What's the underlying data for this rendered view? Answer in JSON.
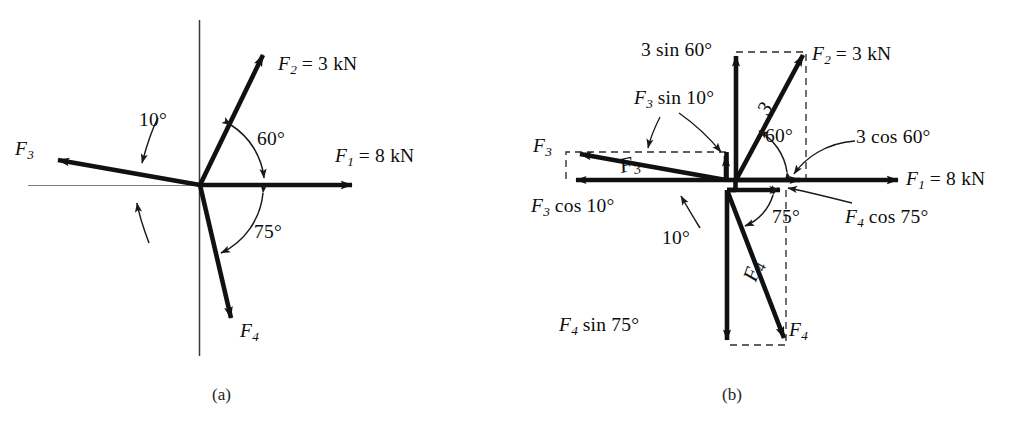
{
  "figure": {
    "background_color": "#ffffff",
    "line_color": "#111111",
    "dashed_color": "#2b2b2b",
    "axis_color": "#3a3a3a"
  },
  "panel_a": {
    "caption": "(a)",
    "labels": {
      "f1": "F1 = 8 kN",
      "f1_sym": "F",
      "f1_sub": "1",
      "f1_val": "= 8 kN",
      "f2_sym": "F",
      "f2_sub": "2",
      "f2_val": "= 3 kN",
      "f3_sym": "F",
      "f3_sub": "3",
      "f4_sym": "F",
      "f4_sub": "4",
      "angle_10": "10°",
      "angle_60": "60°",
      "angle_75": "75°"
    },
    "vectors": [
      {
        "name": "F1",
        "magnitude": "8 kN",
        "angle_deg": 0,
        "direction": "right"
      },
      {
        "name": "F2",
        "magnitude": "3 kN",
        "angle_deg": 60,
        "direction": "up-right"
      },
      {
        "name": "F3",
        "magnitude": "",
        "angle_deg": 190,
        "direction": "up-left"
      },
      {
        "name": "F4",
        "magnitude": "",
        "angle_deg": -75,
        "direction": "down-right"
      }
    ],
    "angles": [
      "10°",
      "60°",
      "75°"
    ]
  },
  "panel_b": {
    "caption": "(b)",
    "labels": {
      "f1_sym": "F",
      "f1_sub": "1",
      "f1_val": "= 8 kN",
      "f2_sym": "F",
      "f2_sub": "2",
      "f2_val": "= 3 kN",
      "f3_sym": "F",
      "f3_sub": "3",
      "f4_sym": "F",
      "f4_sub": "4",
      "three_sin_60": "3 sin 60°",
      "three_cos_60": "3 cos 60°",
      "f3_sin_10_sym": "F",
      "f3_sin_10_sub": "3",
      "f3_sin_10_rest": "sin 10°",
      "f3_cos_10_sym": "F",
      "f3_cos_10_sub": "3",
      "f3_cos_10_rest": "cos 10°",
      "f4_sin_75_sym": "F",
      "f4_sin_75_sub": "4",
      "f4_sin_75_rest": "sin 75°",
      "f4_cos_75_sym": "F",
      "f4_cos_75_sub": "4",
      "f4_cos_75_rest": "cos 75°",
      "angle_10": "10°",
      "angle_60": "60°",
      "angle_75": "75°"
    },
    "on_vector_labels": {
      "f2_on": "3",
      "f3_on": "F",
      "f3_on_sub": "3",
      "f4_on": "F",
      "f4_on_sub": "4"
    },
    "components": [
      {
        "force": "F2",
        "x_component": "3 cos 60°",
        "y_component": "3 sin 60°"
      },
      {
        "force": "F3",
        "x_component": "F3 cos 10°",
        "y_component": "F3 sin 10°"
      },
      {
        "force": "F4",
        "x_component": "F4 cos 75°",
        "y_component": "F4 sin 75°"
      }
    ],
    "angles": [
      "10°",
      "60°",
      "75°"
    ]
  }
}
